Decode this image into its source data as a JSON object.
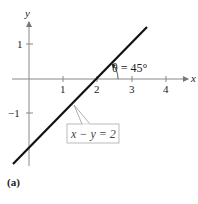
{
  "figure": {
    "caption": "(a)",
    "axes": {
      "x_label": "x",
      "y_label": "y",
      "x_ticks": [
        {
          "value": 1,
          "label": "1"
        },
        {
          "value": 2,
          "label": "2"
        },
        {
          "value": 3,
          "label": "3"
        },
        {
          "value": 4,
          "label": "4"
        }
      ],
      "y_ticks": [
        {
          "value": 1,
          "label": "1"
        },
        {
          "value": -1,
          "label": "−1"
        }
      ]
    },
    "line": {
      "equation_label": "x − y = 2",
      "slope": 1,
      "x_intercept": 2,
      "y_intercept": -2
    },
    "angle": {
      "label": "θ = 45°"
    }
  }
}
